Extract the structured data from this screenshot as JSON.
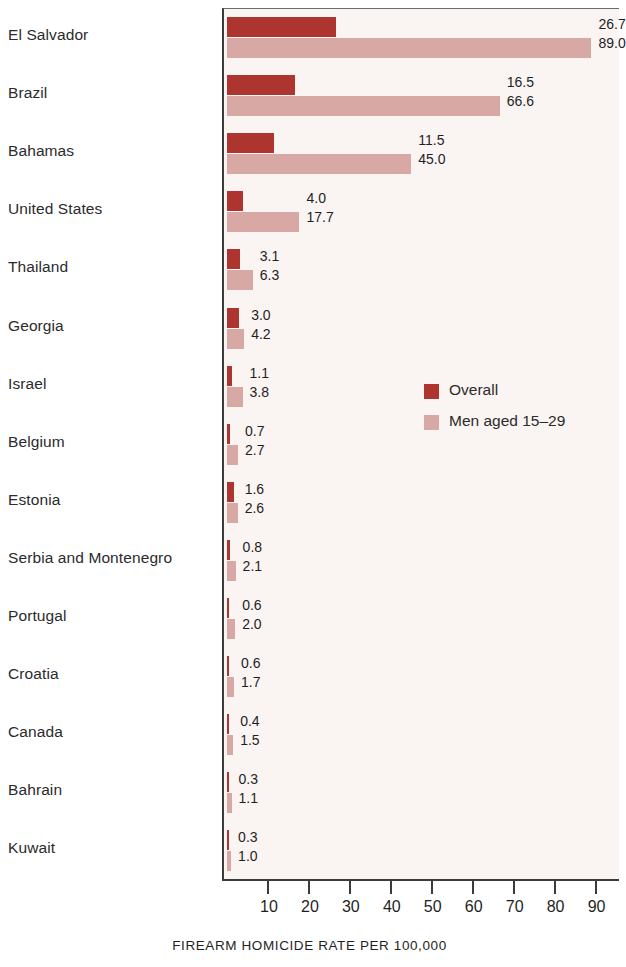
{
  "chart_data": {
    "type": "bar",
    "orientation": "horizontal",
    "title": "",
    "xlabel": "FIREARM HOMICIDE RATE PER 100,000",
    "ylabel": "",
    "xlim": [
      0,
      95.5
    ],
    "xticks": [
      10,
      20,
      30,
      40,
      50,
      60,
      70,
      80,
      90
    ],
    "xticklabels": [
      "10",
      "20",
      "30",
      "40",
      "50",
      "60",
      "70",
      "80",
      "90"
    ],
    "grid": false,
    "legend_position": "inside-right-middle",
    "categories": [
      "El Salvador",
      "Brazil",
      "Bahamas",
      "United States",
      "Thailand",
      "Georgia",
      "Israel",
      "Belgium",
      "Estonia",
      "Serbia and Montenegro",
      "Portugal",
      "Croatia",
      "Canada",
      "Bahrain",
      "Kuwait"
    ],
    "series": [
      {
        "name": "Overall",
        "color": "#ae3430",
        "values": [
          26.7,
          16.5,
          11.5,
          4.0,
          3.1,
          3.0,
          1.1,
          0.7,
          1.6,
          0.8,
          0.6,
          0.6,
          0.4,
          0.3,
          0.3
        ],
        "value_labels": [
          "26.7",
          "16.5",
          "11.5",
          "4.0",
          "3.1",
          "3.0",
          "1.1",
          "0.7",
          "1.6",
          "0.8",
          "0.6",
          "0.6",
          "0.4",
          "0.3",
          "0.3"
        ]
      },
      {
        "name": "Men aged 15–29",
        "color": "#d8a8a4",
        "values": [
          89.0,
          66.6,
          45.0,
          17.7,
          6.3,
          4.2,
          3.8,
          2.7,
          2.6,
          2.1,
          2.0,
          1.7,
          1.5,
          1.1,
          1.0
        ],
        "value_labels": [
          "89.0",
          "66.6",
          "45.0",
          "17.7",
          "6.3",
          "4.2",
          "3.8",
          "2.7",
          "2.6",
          "2.1",
          "2.0",
          "1.7",
          "1.5",
          "1.1",
          "1.0"
        ]
      }
    ]
  },
  "legend": {
    "items": [
      {
        "label": "Overall",
        "color": "#ae3430"
      },
      {
        "label": "Men aged 15–29",
        "color": "#d8a8a4"
      }
    ]
  },
  "axis": {
    "title": "FIREARM HOMICIDE RATE PER 100,000"
  },
  "colors": {
    "overall": "#ae3430",
    "young_men": "#d8a8a4",
    "plot_background": "#faf4f2",
    "axis": "#3b3b3b",
    "text": "#1f1f1f"
  }
}
